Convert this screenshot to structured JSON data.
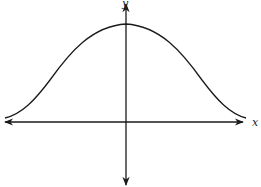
{
  "diagram": {
    "type": "function-graph",
    "axes": {
      "x_label": "x",
      "y_label": "y"
    },
    "curve": {
      "shape": "bell",
      "symmetric_about": "y-axis",
      "maximum_on": "y-axis",
      "asymptote": "x-axis"
    },
    "colors": {
      "stroke": "#1a1a1a",
      "background": "#ffffff"
    }
  }
}
